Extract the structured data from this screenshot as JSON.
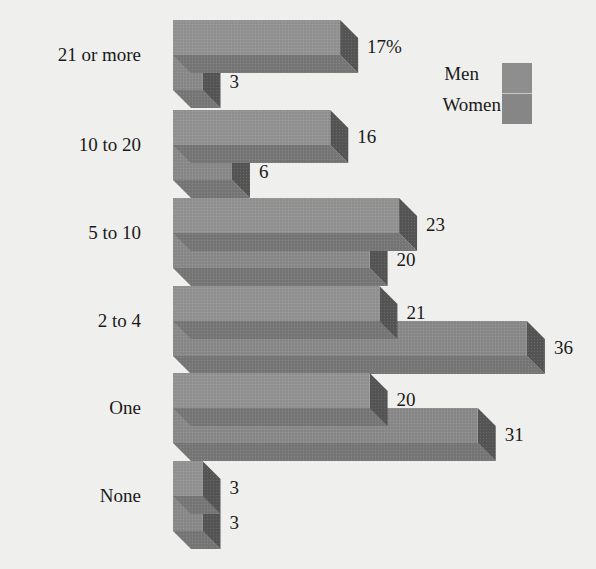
{
  "chart_data": {
    "type": "bar",
    "orientation": "horizontal",
    "style": "3d",
    "title": "",
    "xlabel": "",
    "ylabel": "",
    "categories": [
      "21 or more",
      "10 to 20",
      "5 to 10",
      "2 to 4",
      "One",
      "None"
    ],
    "series": [
      {
        "name": "Men",
        "values": [
          17,
          16,
          23,
          21,
          20,
          3
        ],
        "color": "#8f8f8f"
      },
      {
        "name": "Women",
        "values": [
          3,
          6,
          20,
          36,
          31,
          3
        ],
        "color": "#858585"
      }
    ],
    "value_labels": [
      [
        "17%",
        "3"
      ],
      [
        "16",
        "6"
      ],
      [
        "23",
        "20"
      ],
      [
        "21",
        "36"
      ],
      [
        "20",
        "31"
      ],
      [
        "3",
        "3"
      ]
    ],
    "unit": "%",
    "grid": false,
    "legend_position": "top-right"
  },
  "legend": {
    "items": [
      {
        "label": "Men"
      },
      {
        "label": "Women"
      }
    ]
  },
  "colors": {
    "background": "#efefed",
    "front": "#909090",
    "top": "#a0a0a0",
    "side": "#555555",
    "bottom": "#777777"
  }
}
